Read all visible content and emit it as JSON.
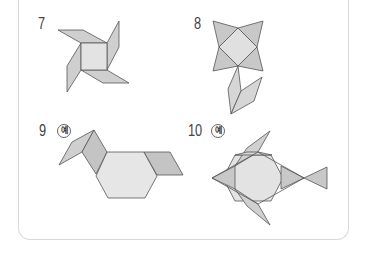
{
  "problems": [
    {
      "number": "7",
      "badge": "",
      "figure": "pinwheel"
    },
    {
      "number": "8",
      "badge": "",
      "figure": "flower"
    },
    {
      "number": "9",
      "badge": "예",
      "figure": "dog"
    },
    {
      "number": "10",
      "badge": "예",
      "figure": "fish"
    }
  ],
  "colors": {
    "light_fill": "#e6e6e6",
    "mid_fill": "#cfcfcf",
    "dark_fill": "#bdbdbd",
    "stroke": "#555555",
    "border": "#d8d8d8"
  }
}
